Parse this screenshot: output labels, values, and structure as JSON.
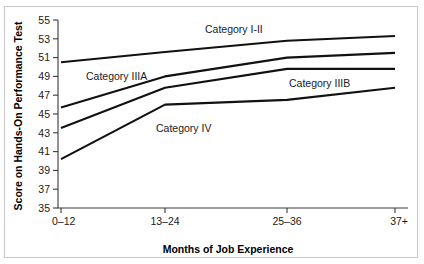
{
  "chart_data": {
    "type": "line",
    "title": "",
    "xlabel": "Months of Job Experience",
    "ylabel": "Score on Hands-On Performance Test",
    "categories": [
      "0–12",
      "13–24",
      "25–36",
      "37+"
    ],
    "ylim": [
      35,
      55
    ],
    "ytick_values": [
      35,
      37,
      39,
      41,
      43,
      45,
      47,
      49,
      51,
      53,
      55
    ],
    "ytick_labels": [
      "35",
      "37",
      "39",
      "41",
      "43",
      "45",
      "47",
      "49",
      "51",
      "53",
      "55"
    ],
    "grid": false,
    "legend_position": "inline-annotations",
    "series": [
      {
        "name": "Category I-II",
        "label": "Category I-II",
        "values": [
          50.5,
          51.6,
          52.8,
          53.3
        ],
        "color": "#111111"
      },
      {
        "name": "Category IIIA",
        "label": "Category IIIA",
        "values": [
          45.7,
          49.0,
          51.0,
          51.5
        ],
        "color": "#111111"
      },
      {
        "name": "Category IIIB",
        "label": "Category IIIB",
        "values": [
          43.5,
          47.8,
          49.8,
          49.8
        ],
        "color": "#111111"
      },
      {
        "name": "Category IV",
        "label": "Category IV",
        "values": [
          40.2,
          46.0,
          46.5,
          47.8
        ],
        "color": "#111111"
      }
    ],
    "annotations": [
      {
        "text": "Category I-II",
        "x_frac": 0.42,
        "value": 53.6
      },
      {
        "text": "Category IIIA",
        "x_frac": 0.08,
        "value": 48.6
      },
      {
        "text": "Category IIIB",
        "x_frac": 0.66,
        "value": 47.9
      },
      {
        "text": "Category IV",
        "x_frac": 0.28,
        "value": 43.1
      }
    ]
  },
  "axes": {
    "y_title": "Score on Hands-On Performance Test",
    "x_title": "Months of Job Experience"
  }
}
